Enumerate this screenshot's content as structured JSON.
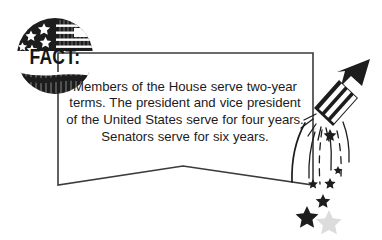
{
  "graphic": {
    "title": "FACT callout with patriotic seal and firework rocket",
    "background_color": "#ffffff",
    "ink_color": "#1d1d1d",
    "outline_color": "#3b3b3b",
    "ghost_color": "#dcdcdc"
  },
  "badge": {
    "label": "FACT:",
    "icon": "us-flag-seal-icon",
    "shape": "circle",
    "star_count": 6,
    "stripe_count": 4
  },
  "callout": {
    "text": "Members of the House serve two-year terms. The president and vice president of the United States serve for four years. Senators serve for six years.",
    "shape": "banner-with-chevron-bottom"
  },
  "decorations": {
    "rocket": "firework-rocket-icon",
    "sparks": "spark-trail-icon",
    "stars": [
      {
        "name": "falling-star-small",
        "size": 9
      },
      {
        "name": "falling-star-small",
        "size": 10
      },
      {
        "name": "falling-star-medium",
        "size": 13
      },
      {
        "name": "falling-star-large",
        "size": 20
      },
      {
        "name": "falling-star-tiny",
        "size": 8
      }
    ],
    "ghost_stars": [
      {
        "name": "watermark-star-left",
        "size": 16
      },
      {
        "name": "watermark-star-mid",
        "size": 14
      },
      {
        "name": "watermark-star-bottom",
        "size": 24
      }
    ]
  }
}
